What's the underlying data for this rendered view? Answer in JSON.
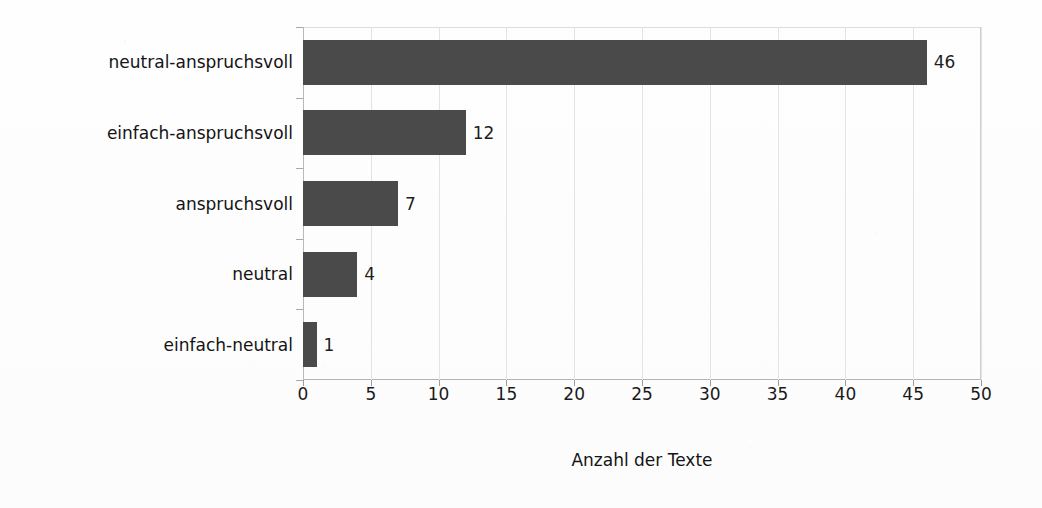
{
  "chart_data": {
    "type": "bar",
    "orientation": "horizontal",
    "title": "",
    "xlabel": "Anzahl der Texte",
    "ylabel": "Lexikalischer Komplexitätsgrad",
    "categories": [
      "neutral-anspruchsvoll",
      "einfach-anspruchsvoll",
      "anspruchsvoll",
      "neutral",
      "einfach-neutral"
    ],
    "values": [
      46,
      12,
      7,
      4,
      1
    ],
    "data_labels": [
      "46",
      "12",
      "7",
      "4",
      "1"
    ],
    "xlim": [
      0,
      50
    ],
    "xticks": [
      0,
      5,
      10,
      15,
      20,
      25,
      30,
      35,
      40,
      45,
      50
    ],
    "xtick_labels": [
      "0",
      "5",
      "10",
      "15",
      "20",
      "25",
      "30",
      "35",
      "40",
      "45",
      "50"
    ],
    "grid": "vertical",
    "legend": "none",
    "bar_color": "#4a4a4a",
    "gridline_color": "#e3e3e3",
    "axis_color": "#b9b9b9",
    "background_color": "#fefefe"
  }
}
